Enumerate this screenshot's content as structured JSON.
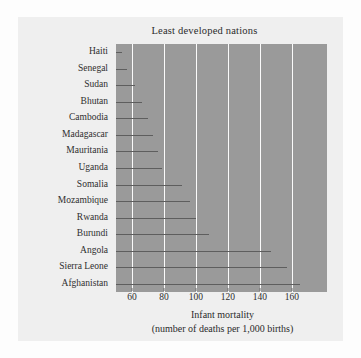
{
  "chart_data": {
    "type": "bar",
    "title": "Least developed nations",
    "xlabel": "Infant mortality",
    "xlabel_sub": "(number of deaths per 1,000 births)",
    "ylabel": "",
    "orientation": "horizontal",
    "grid": "vertical-white-gridlines",
    "legend": "none",
    "xlim": [
      50,
      182
    ],
    "xticks": [
      60,
      80,
      100,
      120,
      140,
      160
    ],
    "categories": [
      "Haiti",
      "Senegal",
      "Sudan",
      "Bhutan",
      "Cambodia",
      "Madagascar",
      "Mauritania",
      "Uganda",
      "Somalia",
      "Mozambique",
      "Rwanda",
      "Burundi",
      "Angola",
      "Sierra Leone",
      "Afghanistan"
    ],
    "values": [
      54,
      57,
      62,
      66,
      70,
      73,
      76,
      79,
      91,
      96,
      100,
      108,
      147,
      157,
      165
    ]
  },
  "colors": {
    "page_background": "#fdfdfd",
    "figure_background": "#efefef",
    "plot_panel": "#9a9a9a",
    "gridline": "#fbfbfb",
    "data_line": "#5e5e5e",
    "text": "#2b2b2b"
  }
}
